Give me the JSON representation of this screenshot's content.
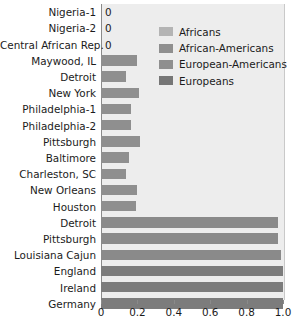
{
  "chart_data": {
    "type": "bar",
    "orientation": "horizontal",
    "title": "",
    "xlabel": "",
    "ylabel": "",
    "xlim": [
      0,
      1.0
    ],
    "xticks": [
      0,
      0.2,
      0.4,
      0.6,
      0.8,
      1.0
    ],
    "xticklabels": [
      "0",
      "0.2",
      "0.4",
      "0.6",
      "0.8",
      "1.0"
    ],
    "grid": false,
    "legend_position": "upper right inside plot",
    "legend": [
      {
        "name": "Africans",
        "color": "#b4b4b4"
      },
      {
        "name": "African-Americans",
        "color": "#8f8f8f"
      },
      {
        "name": "European-Americans",
        "color": "#8f8f8f"
      },
      {
        "name": "Europeans",
        "color": "#767676"
      }
    ],
    "categories": [
      "Nigeria-1",
      "Nigeria-2",
      "Central African Rep.",
      "Maywood, IL",
      "Detroit",
      "New York",
      "Philadelphia-1",
      "Philadelphia-2",
      "Pittsburgh",
      "Baltimore",
      "Charleston, SC",
      "New Orleans",
      "Houston",
      "Detroit",
      "Pittsburgh",
      "Louisiana Cajun",
      "England",
      "Ireland",
      "Germany"
    ],
    "values": [
      0,
      0,
      0,
      0.2,
      0.14,
      0.21,
      0.165,
      0.165,
      0.215,
      0.155,
      0.135,
      0.2,
      0.195,
      0.975,
      0.97,
      0.99,
      1.0,
      1.0,
      1.0
    ],
    "group": [
      "Africans",
      "Africans",
      "Africans",
      "African-Americans",
      "African-Americans",
      "African-Americans",
      "African-Americans",
      "African-Americans",
      "African-Americans",
      "African-Americans",
      "African-Americans",
      "African-Americans",
      "African-Americans",
      "European-Americans",
      "European-Americans",
      "European-Americans",
      "Europeans",
      "Europeans",
      "Europeans"
    ],
    "bar_colors": [
      "#b4b4b4",
      "#b4b4b4",
      "#b4b4b4",
      "#8f8f8f",
      "#8f8f8f",
      "#8f8f8f",
      "#8f8f8f",
      "#8f8f8f",
      "#8f8f8f",
      "#8f8f8f",
      "#8f8f8f",
      "#8f8f8f",
      "#8f8f8f",
      "#8a8a8a",
      "#8a8a8a",
      "#8a8a8a",
      "#7c7c7c",
      "#7c7c7c",
      "#7c7c7c"
    ],
    "zero_labels": [
      "0",
      "0",
      "0"
    ]
  }
}
